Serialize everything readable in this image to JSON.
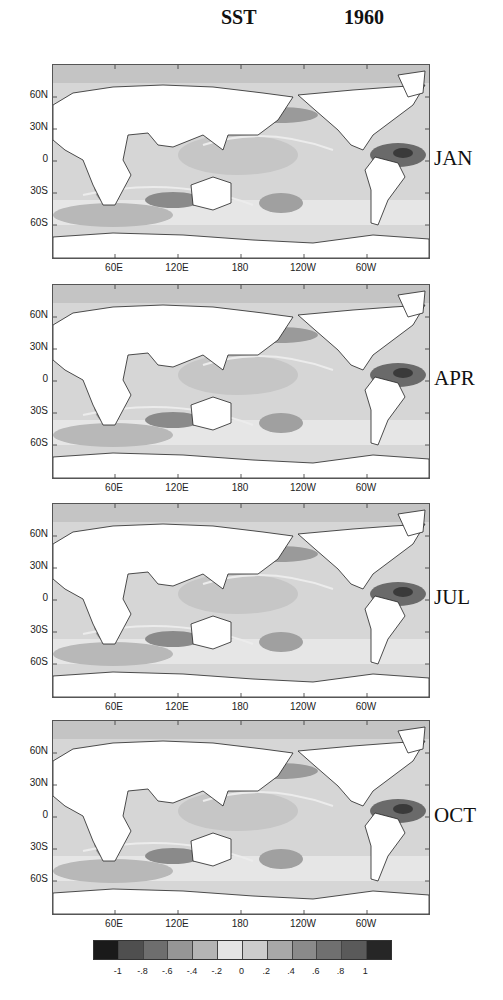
{
  "header": {
    "variable": "SST",
    "year": "1960"
  },
  "axes": {
    "y_ticks": [
      "60N",
      "30N",
      "0",
      "30S",
      "60S"
    ],
    "x_ticks": [
      "60E",
      "120E",
      "180",
      "120W",
      "60W"
    ]
  },
  "panels": [
    {
      "month": "JAN"
    },
    {
      "month": "APR"
    },
    {
      "month": "JUL"
    },
    {
      "month": "OCT"
    }
  ],
  "colorbar": {
    "ticks": [
      "-1",
      "-.8",
      "-.6",
      "-.4",
      "-.2",
      "0",
      ".2",
      ".4",
      ".6",
      ".8",
      "1"
    ],
    "colors": [
      "#1a1a1a",
      "#4f4f4f",
      "#6e6e6e",
      "#969696",
      "#b4b4b4",
      "#e4e4e4",
      "#cdcdcd",
      "#a8a8a8",
      "#8a8a8a",
      "#707070",
      "#5a5a5a",
      "#262626"
    ]
  },
  "chart_data": {
    "type": "heatmap",
    "subplots": [
      "JAN",
      "APR",
      "JUL",
      "OCT"
    ],
    "xlabel": "Longitude",
    "ylabel": "Latitude",
    "x_ticks": [
      "60E",
      "120E",
      "180",
      "120W",
      "60W"
    ],
    "y_ticks": [
      "60N",
      "30N",
      "0",
      "30S",
      "60S"
    ],
    "xlim": [
      "0E",
      "360E"
    ],
    "ylim": [
      "90S",
      "90N"
    ],
    "colorbar": {
      "ticks": [
        -1,
        -0.8,
        -0.6,
        -0.4,
        -0.2,
        0,
        0.2,
        0.4,
        0.6,
        0.8,
        1
      ],
      "levels": 12,
      "colormap": "grayscale (dark at both extremes, light near 0)"
    },
    "grid": false,
    "legend_position": "bottom colorbar"
  }
}
